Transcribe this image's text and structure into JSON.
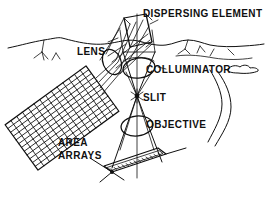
{
  "figure": {
    "background_color": "#ffffff",
    "ink_color": "#101010",
    "style": "black-and-white line drawing"
  },
  "labels": {
    "dispersing_element": "DISPERSING ELEMENT",
    "lens": "LENS",
    "colluminator": "COLLUMINATOR",
    "slit": "SLIT",
    "objective": "OBJECTIVE",
    "area_arrays_line1": "AREA",
    "area_arrays_line2": "ARRAYS"
  },
  "components": {
    "dispersing_element": {
      "name": "dispersing-element",
      "shape": "tilted parallelogram prism",
      "position": "top-center"
    },
    "lens": {
      "name": "lens",
      "shape": "ellipse",
      "position": "upper-left of optical axis"
    },
    "colluminator": {
      "name": "colluminator",
      "shape": "ellipse",
      "position": "upper-center on optical axis"
    },
    "slit": {
      "name": "slit",
      "shape": "point marker",
      "position": "center of optical axis"
    },
    "objective": {
      "name": "objective",
      "shape": "ellipse",
      "position": "lower-center on optical axis"
    },
    "area_arrays": {
      "name": "area-arrays",
      "shape": "rotated rectangular grid detector",
      "grid_columns": 14,
      "grid_rows": 12,
      "position": "left"
    },
    "linear_array": {
      "name": "linear-array-plate",
      "shape": "hatched narrow plate",
      "position": "bottom-center"
    },
    "terrain": {
      "name": "terrain-horizon",
      "shape": "mountain ridge line across scene"
    },
    "river": {
      "name": "river",
      "shape": "curved double line",
      "position": "right"
    },
    "cloud": {
      "name": "cloud",
      "shape": "small lobed outline",
      "position": "right of colluminator label"
    }
  }
}
